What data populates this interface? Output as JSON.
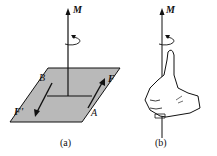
{
  "figure_a": {
    "caption": "(a)",
    "moment_label": "M",
    "point_b": "B",
    "point_a": "A",
    "force_f": "F",
    "force_f_prime": "F'"
  },
  "figure_b": {
    "caption": "(b)",
    "moment_label": "M"
  },
  "colors": {
    "plane_fill": "#b9b9b9",
    "stroke": "#111111"
  }
}
